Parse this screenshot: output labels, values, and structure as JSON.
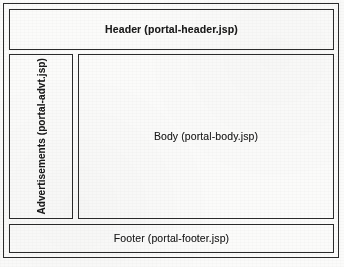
{
  "diagram": {
    "background_color": "#fbfbfa",
    "line_color": "#2b2b2b",
    "text_color": "#1a1a1a",
    "regions": {
      "header": {
        "label": "Header (portal-header.jsp)",
        "name": "Header",
        "file": "portal-header.jsp"
      },
      "advertisements": {
        "label": "Advertisements (portal-advt.jsp)",
        "name": "Advertisements",
        "file": "portal-advt.jsp",
        "orientation": "vertical-bottom-to-top"
      },
      "body": {
        "label": "Body (portal-body.jsp)",
        "name": "Body",
        "file": "portal-body.jsp"
      },
      "footer": {
        "label": "Footer (portal-footer.jsp)",
        "name": "Footer",
        "file": "portal-footer.jsp"
      }
    }
  }
}
